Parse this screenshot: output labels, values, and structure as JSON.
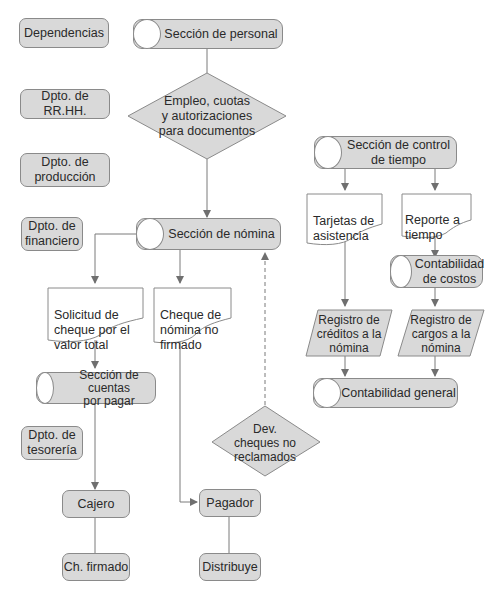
{
  "departments": [
    {
      "label": "Dependencias"
    },
    {
      "label": "Dpto. de RR.HH."
    },
    {
      "label": "Dpto. de\nproducción"
    },
    {
      "label": "Dpto. de\nfinanciero"
    },
    {
      "label": "Dpto. de\ntesorería"
    }
  ],
  "flow": {
    "seccion_personal": "Sección de personal",
    "decision_empleo": "Empleo, cuotas\ny autorizaciones\npara documentos",
    "seccion_nomina": "Sección de nómina",
    "doc_solicitud": "Solicitud de\ncheque por el\nvalor total",
    "doc_cheque": "Cheque de\nnómina no\nfirmado",
    "seccion_cuentas": "Sección de cuentas\npor pagar",
    "cajero": "Cajero",
    "ch_firmado": "Ch. firmado",
    "pagador": "Pagador",
    "distribuye": "Distribuye",
    "decision_dev": "Dev.\ncheques no\nreclamados",
    "seccion_control": "Sección de control\nde tiempo",
    "doc_tarjetas": "Tarjetas de\nasistencia",
    "doc_reporte": "Reporte a\ntiempo",
    "contabilidad_costos": "Contabilidad\nde costos",
    "registro_creditos": "Registro de\ncréditos a la\nnómina",
    "registro_cargos": "Registro de\ncargos a la\nnómina",
    "contabilidad_general": "Contabilidad general"
  },
  "colors": {
    "fill": "#d9d9d9",
    "stroke": "#8a8a8a",
    "line": "#7a7a7a",
    "text": "#2a2a2a"
  }
}
